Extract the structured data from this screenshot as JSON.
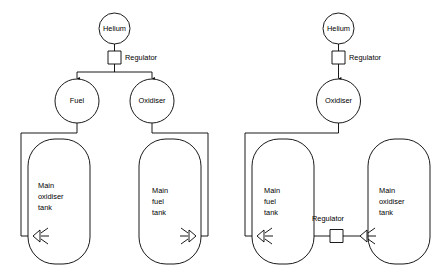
{
  "diagram": {
    "type": "engineering-schematic",
    "background_color": "#ffffff",
    "line_color": "#000000",
    "text_color": "#000000",
    "systems": [
      {
        "id": "left-system",
        "name": "Dual helium-fed pressurisation system",
        "nodes": {
          "helium": {
            "label": "Helium",
            "shape": "circle"
          },
          "regulator": {
            "label": "Regulator",
            "shape": "square"
          },
          "fuel_sphere": {
            "label": "Fuel",
            "shape": "circle"
          },
          "oxidiser_sphere": {
            "label": "Oxidiser",
            "shape": "circle"
          },
          "tank_left": {
            "label": "Main\noxidiser\ntank",
            "line1": "Main",
            "line2": "oxidiser",
            "line3": "tank",
            "shape": "rounded-tank"
          },
          "tank_right": {
            "label": "Main\nfuel\ntank",
            "line1": "Main",
            "line2": "fuel",
            "line3": "tank",
            "shape": "rounded-tank"
          },
          "thruster_left": {
            "label": "",
            "shape": "nozzle",
            "direction": "left"
          },
          "thruster_right": {
            "label": "",
            "shape": "nozzle",
            "direction": "right"
          }
        }
      },
      {
        "id": "right-system",
        "name": "Single helium-fed pressurisation system with inter-tank regulator",
        "nodes": {
          "helium": {
            "label": "Helium",
            "shape": "circle"
          },
          "regulator_top": {
            "label": "Regulator",
            "shape": "square"
          },
          "oxidiser_sphere": {
            "label": "Oxidiser",
            "shape": "circle"
          },
          "tank_left": {
            "label": "Main\nfuel\ntank",
            "line1": "Main",
            "line2": "fuel",
            "line3": "tank",
            "shape": "rounded-tank"
          },
          "tank_right": {
            "label": "Main\noxidiser\ntank",
            "line1": "Main",
            "line2": "oxidiser",
            "line3": "tank",
            "shape": "rounded-tank"
          },
          "regulator_bottom": {
            "label": "Regulator",
            "shape": "square"
          },
          "thruster_left": {
            "label": "",
            "shape": "nozzle",
            "direction": "left"
          },
          "thruster_right": {
            "label": "",
            "shape": "nozzle",
            "direction": "left"
          }
        }
      }
    ]
  }
}
